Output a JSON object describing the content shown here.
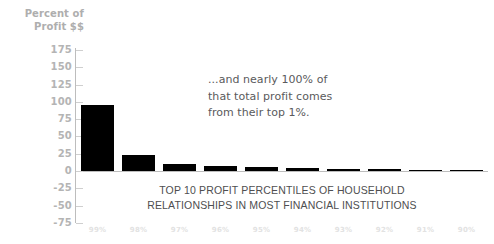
{
  "chart_data": {
    "type": "bar",
    "title": "",
    "subtitle": "",
    "xlabel": "",
    "ylabel": "Percent of Profit $$",
    "ylabel_lines": [
      "Percent of",
      "Profit $$"
    ],
    "categories": [
      "99%",
      "98%",
      "97%",
      "96%",
      "95%",
      "94%",
      "93%",
      "92%",
      "91%",
      "90%"
    ],
    "values": [
      96,
      23,
      10,
      7,
      5.5,
      4,
      3,
      2.5,
      2,
      1.5
    ],
    "ylim": [
      -75,
      175
    ],
    "yticks": [
      175,
      150,
      125,
      100,
      75,
      50,
      25,
      0,
      -25,
      -50,
      -75
    ],
    "ytick_labels": [
      "175",
      "150",
      "125",
      "100",
      "75",
      "50",
      "25",
      "0",
      "-25",
      "-50",
      "-75"
    ],
    "grid": false,
    "legend": "none",
    "bar_color": "#000000",
    "axis_color": "#bdbdbd",
    "ytick_label_color": "#b4b4b4",
    "xtick_label_color": "#e2e2e2",
    "background": "#ffffff",
    "annotations": [
      {
        "name": "callout",
        "lines": [
          "...and nearly 100% of",
          "that total profit comes",
          "from their top 1%."
        ],
        "color": "#5a5a5c"
      },
      {
        "name": "caption",
        "lines": [
          "TOP 10 PROFIT PERCENTILES OF HOUSEHOLD",
          "RELATIONSHIPS IN MOST FINANCIAL INSTITUTIONS"
        ],
        "color": "#4e4e50"
      }
    ]
  }
}
